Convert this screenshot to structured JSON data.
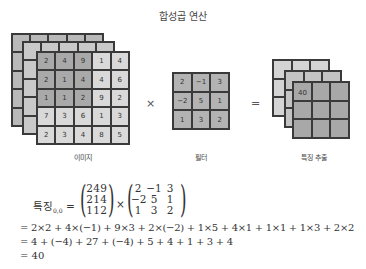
{
  "title": "합성곱 연산",
  "image": {
    "label": "이미지",
    "front_matrix": [
      [
        "2",
        "4",
        "9",
        "1",
        "4"
      ],
      [
        "2",
        "1",
        "4",
        "4",
        "6"
      ],
      [
        "1",
        "1",
        "2",
        "9",
        "2"
      ],
      [
        "7",
        "3",
        "6",
        "1",
        "3"
      ],
      [
        "2",
        "3",
        "4",
        "8",
        "5"
      ]
    ],
    "highlight_region": "rows 0-2, cols 0-2"
  },
  "operator_multiply": "×",
  "filter": {
    "label": "필터",
    "matrix": [
      [
        "2",
        "−1",
        "3"
      ],
      [
        "−2",
        "5",
        "1"
      ],
      [
        "1",
        "3",
        "2"
      ]
    ]
  },
  "operator_equals": "=",
  "feature": {
    "label": "특징 추출",
    "first_value": "40"
  },
  "equation": {
    "lhs": "특징",
    "subscript": "0,0",
    "eq": "=",
    "times": "×",
    "matrix_a": [
      [
        "2",
        "4",
        "9"
      ],
      [
        "2",
        "1",
        "4"
      ],
      [
        "1",
        "1",
        "2"
      ]
    ],
    "matrix_b": [
      [
        "2",
        "−1",
        "3"
      ],
      [
        "−2",
        "5",
        "1"
      ],
      [
        "1",
        "3",
        "2"
      ]
    ],
    "line2": "= 2×2 + 4×(−1) + 9×3 + 2×(−2) + 1×5 + 4×1 + 1×1 + 1×3 + 2×2",
    "line3": "= 4 + (−4) + 27 + (−4) + 5 + 4 + 1 + 3 + 4",
    "line4": "= 40"
  },
  "colors": {
    "highlight": "#a9a9a9",
    "cell": "#d9d9d9",
    "filter": "#b3b3b3",
    "output": "#a8a8a8"
  }
}
